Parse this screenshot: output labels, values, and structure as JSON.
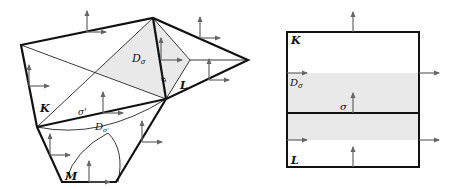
{
  "left_figure": {
    "labels": {
      "K": "K",
      "L": "L",
      "M": "M",
      "D_sigma": "D",
      "D_sigma_sub": "σ",
      "sigma": "σ",
      "sigma_prime": "σ'",
      "D_sigma_prime": "D",
      "D_sigma_prime_sub": "σ'"
    }
  },
  "right_figure": {
    "labels": {
      "K": "K",
      "L": "L",
      "D_sigma": "D",
      "D_sigma_sub": "σ",
      "sigma": "σ"
    }
  },
  "colors": {
    "shade": "#e9e9e9",
    "edge": "#111111",
    "arrow": "#666666"
  }
}
